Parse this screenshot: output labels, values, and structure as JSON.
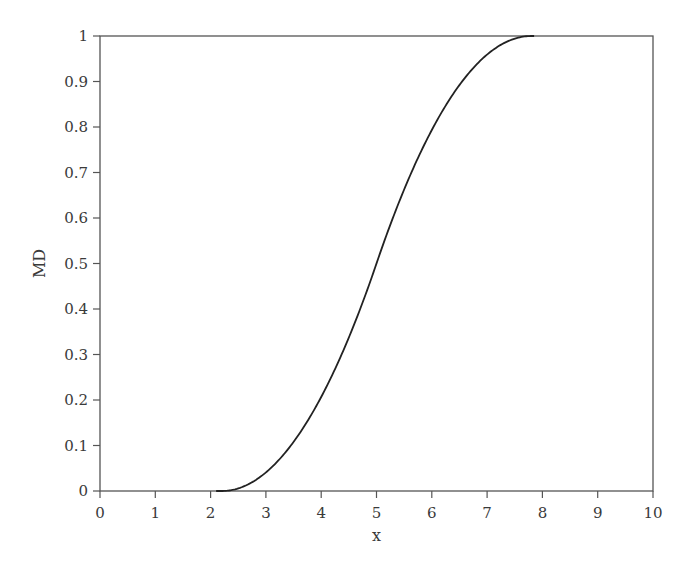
{
  "chart_data": {
    "type": "line",
    "title": "",
    "xlabel": "x",
    "ylabel": "MD",
    "xlim": [
      0,
      10
    ],
    "ylim": [
      0,
      1
    ],
    "grid": false,
    "legend": null,
    "x_ticks": [
      "0",
      "1",
      "2",
      "3",
      "4",
      "5",
      "6",
      "7",
      "8",
      "9",
      "10"
    ],
    "y_ticks": [
      "0",
      "0.1",
      "0.2",
      "0.3",
      "0.4",
      "0.5",
      "0.6",
      "0.7",
      "0.8",
      "0.9",
      "1"
    ],
    "series": [
      {
        "name": "MD",
        "color": "#222222",
        "x": [
          0,
          2.2,
          2.5,
          3,
          3.5,
          4,
          4.5,
          5,
          5.5,
          6,
          6.5,
          7,
          7.5,
          7.8,
          10
        ],
        "y": [
          0,
          0,
          0.006,
          0.041,
          0.108,
          0.207,
          0.337,
          0.5,
          0.663,
          0.793,
          0.892,
          0.959,
          0.994,
          1,
          1
        ]
      }
    ]
  },
  "colors": {
    "axis": "#555555",
    "curve": "#222222",
    "background": "#ffffff"
  }
}
